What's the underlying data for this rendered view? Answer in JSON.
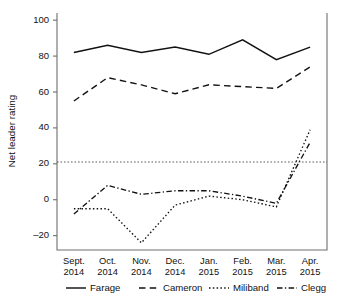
{
  "chart_data": {
    "type": "line",
    "title": "",
    "xlabel": "",
    "ylabel": "Net leader rating",
    "categories": [
      "Sept.\n2014",
      "Oct.\n2014",
      "Nov.\n2014",
      "Dec.\n2014",
      "Jan.\n2015",
      "Feb.\n2015",
      "Mar.\n2015",
      "Apr.\n2015"
    ],
    "category_lines": [
      [
        "Sept.",
        "2014"
      ],
      [
        "Oct.",
        "2014"
      ],
      [
        "Nov.",
        "2014"
      ],
      [
        "Dec.",
        "2014"
      ],
      [
        "Jan.",
        "2015"
      ],
      [
        "Feb.",
        "2015"
      ],
      [
        "Mar.",
        "2015"
      ],
      [
        "Apr.",
        "2015"
      ]
    ],
    "ylim": [
      -28,
      104
    ],
    "yticks": [
      -20,
      0,
      20,
      40,
      60,
      80,
      100
    ],
    "ytick_labels": [
      "–20",
      "0",
      "20",
      "40",
      "60",
      "80",
      "100"
    ],
    "grid": false,
    "zero_reference_line": true,
    "legend_position": "bottom",
    "series": [
      {
        "name": "Farage",
        "style": "solid",
        "values": [
          82,
          86,
          82,
          85,
          81,
          89,
          78,
          85
        ]
      },
      {
        "name": "Cameron",
        "style": "dashed",
        "values": [
          55,
          68,
          64,
          59,
          64,
          63,
          62,
          74
        ]
      },
      {
        "name": "Miliband",
        "style": "dotted",
        "values": [
          -5,
          -5,
          -24,
          -3,
          2,
          0,
          -4,
          39
        ]
      },
      {
        "name": "Clegg",
        "style": "dash-dotted",
        "values": [
          -8,
          8,
          3,
          5,
          5,
          2,
          -2,
          32
        ]
      }
    ]
  },
  "legend": {
    "items": [
      {
        "label": "Farage"
      },
      {
        "label": "Cameron"
      },
      {
        "label": "Miliband"
      },
      {
        "label": "Clegg"
      }
    ]
  },
  "axis": {
    "y_title": "Net leader rating"
  }
}
